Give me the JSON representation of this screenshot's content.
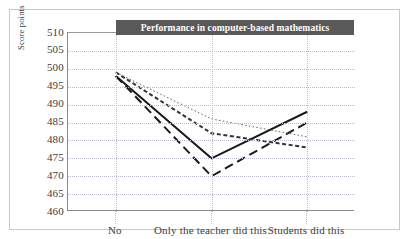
{
  "chart_data": {
    "type": "line",
    "title": "Performance in computer-based mathematics",
    "xlabel": "",
    "ylabel": "Score points",
    "categories": [
      "No",
      "Only the teacher did this",
      "Students did this"
    ],
    "ylim": [
      460,
      510
    ],
    "yticks": [
      510,
      505,
      500,
      495,
      490,
      485,
      480,
      475,
      470,
      465,
      460
    ],
    "grid": true,
    "legend": "none",
    "series": [
      {
        "name": "series-solid-thick",
        "style": "solid",
        "color": "#1a1a1a",
        "width": 2.0,
        "values": [
          498,
          475,
          488
        ]
      },
      {
        "name": "series-dashed-long",
        "style": "dashed-long",
        "color": "#1a1a1a",
        "width": 2.0,
        "values": [
          498,
          470,
          485
        ]
      },
      {
        "name": "series-dashed-short",
        "style": "dashed-short",
        "color": "#333333",
        "width": 2.0,
        "values": [
          499,
          482,
          478
        ]
      },
      {
        "name": "series-dotted-fine",
        "style": "dotted-fine",
        "color": "#6b6b6b",
        "width": 1.0,
        "values": [
          499,
          486,
          481
        ]
      }
    ]
  },
  "colors": {
    "title_banner": "#595959",
    "title_text": "#ffffff",
    "gridline": "#b9bfd0",
    "axis": "#8a8a8a",
    "tick_text": "#3d3d3d",
    "background": "#ffffff"
  }
}
